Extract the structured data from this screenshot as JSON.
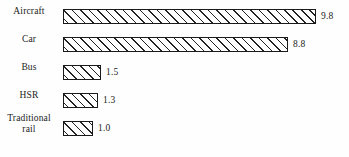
{
  "chart_data": {
    "type": "bar",
    "orientation": "horizontal",
    "title": "",
    "subtitle": "",
    "xlabel": "",
    "ylabel": "",
    "grid": false,
    "legend": null,
    "axis_visible": false,
    "categories": [
      "Aircraft",
      "Car",
      "Bus",
      "HSR",
      "Traditional rail"
    ],
    "values": [
      9.8,
      8.8,
      1.5,
      1.3,
      1.0
    ],
    "value_labels": [
      "9.8",
      "8.8",
      "1.5",
      "1.3",
      "1.0"
    ],
    "xlim": [
      0,
      10
    ],
    "bar_style": {
      "fill": "#ffffff",
      "edge_color": "#1a1a1a",
      "hatch": "forward-diagonal",
      "hatch_color": "#232323"
    },
    "bars": [
      {
        "category": "Aircraft",
        "label_lines": [
          "Aircraft"
        ],
        "value": 9.8,
        "value_label": "9.8",
        "pixel_width": 253,
        "row_top": 3
      },
      {
        "category": "Car",
        "label_lines": [
          "Car"
        ],
        "value": 8.8,
        "value_label": "8.8",
        "pixel_width": 225,
        "row_top": 31
      },
      {
        "category": "Bus",
        "label_lines": [
          "Bus"
        ],
        "value": 1.5,
        "value_label": "1.5",
        "pixel_width": 38,
        "row_top": 59
      },
      {
        "category": "HSR",
        "label_lines": [
          "HSR"
        ],
        "value": 1.3,
        "value_label": "1.3",
        "pixel_width": 35,
        "row_top": 87
      },
      {
        "category": "Traditional rail",
        "label_lines": [
          "Traditional",
          "rail"
        ],
        "value": 1.0,
        "value_label": "1.0",
        "pixel_width": 30,
        "row_top": 115
      }
    ]
  }
}
